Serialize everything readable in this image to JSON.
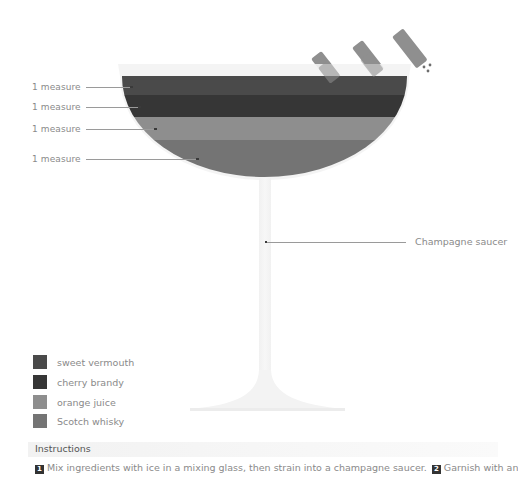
{
  "drink": {
    "glass": "Champagne saucer",
    "layers": [
      {
        "amount": "1 measure",
        "ingredient": "sweet vermouth",
        "color": "#4a4a4a"
      },
      {
        "amount": "1 measure",
        "ingredient": "cherry brandy",
        "color": "#3a3a3a"
      },
      {
        "amount": "1 measure",
        "ingredient": "orange juice",
        "color": "#8c8c8c"
      },
      {
        "amount": "1 measure",
        "ingredient": "Scotch whisky",
        "color": "#737373"
      }
    ]
  },
  "legend": {
    "items": [
      {
        "label": "sweet vermouth",
        "color": "#4a4a4a"
      },
      {
        "label": "cherry brandy",
        "color": "#363636"
      },
      {
        "label": "orange juice",
        "color": "#8e8e8e"
      },
      {
        "label": "Scotch whisky",
        "color": "#747474"
      }
    ]
  },
  "instructions": {
    "title": "Instructions",
    "steps": [
      {
        "num": "1",
        "text": "Mix ingredients with ice in a mixing glass, then strain into a champagne saucer."
      },
      {
        "num": "2",
        "text": "Garnish with an"
      }
    ]
  },
  "garnish": {
    "count": 3,
    "color": "#8f8f8f"
  }
}
